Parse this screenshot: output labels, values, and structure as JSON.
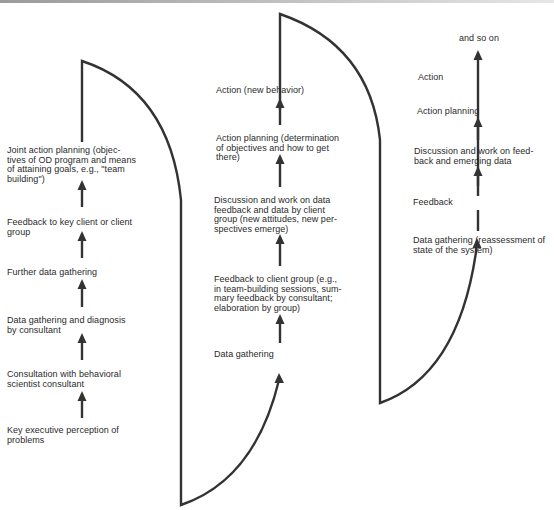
{
  "stage1": {
    "items": [
      "Joint action planning (objec-\ntives of OD program and means\nof attaining goals, e.g., \"team\nbuilding\")",
      "Feedback to key client or client\ngroup",
      "Further data gathering",
      "Data gathering and diagnosis\nby consultant",
      "Consultation with behavioral\nscientist consultant",
      "Key executive perception of\nproblems"
    ]
  },
  "stage2": {
    "items": [
      "Action (new behavior)",
      "Action planning (determination\nof objectives and how to get\nthere)",
      "Discussion and work on data\nfeedback and data by client\ngroup (new attitudes, new per-\nspectives emerge)",
      "Feedback to client group (e.g.,\nin team-building sessions, sum-\nmary feedback by consultant;\nelaboration by group)",
      "Data gathering"
    ]
  },
  "stage3": {
    "items": [
      "and so on",
      "Action",
      "Action planning",
      "Discussion and work on feed-\nback and emerging data",
      "Feedback",
      "Data gathering (reassessment of\nstate of the system)"
    ]
  },
  "colors": {
    "line": "#333333",
    "text": "#2a2a2a"
  }
}
